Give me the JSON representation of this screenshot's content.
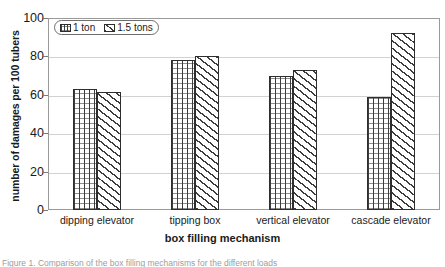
{
  "chart_data": {
    "type": "bar",
    "title": "",
    "xlabel": "box filling mechanism",
    "ylabel": "number of damages per 100 tubers",
    "categories": [
      "dipping elevator",
      "tipping box",
      "vertical elevator",
      "cascade elevator"
    ],
    "series": [
      {
        "name": "1 ton",
        "values": [
          63,
          78,
          70,
          59
        ]
      },
      {
        "name": "1.5 tons",
        "values": [
          61.5,
          80,
          73,
          92
        ]
      }
    ],
    "ylim": [
      0,
      100
    ],
    "yticks": [
      0,
      20,
      40,
      60,
      80,
      100
    ],
    "ytick_labels": [
      "0",
      "20",
      "40",
      "60",
      "80",
      "100"
    ],
    "grid": "horizontal",
    "legend_position": "top-left-inside",
    "legend_entries": [
      "1 ton",
      "1.5 tons"
    ],
    "patterns": [
      "vertical-grid-hatch",
      "diagonal-hatch"
    ]
  },
  "legend": {
    "items": [
      {
        "label": "1 ton",
        "swatch": "vertical-grid-hatch-swatch"
      },
      {
        "label": "1.5 tons",
        "swatch": "diagonal-hatch-swatch"
      }
    ]
  },
  "caption": {
    "text": "Figure 1. Comparison of the box filling mechanisms for the different loads"
  }
}
